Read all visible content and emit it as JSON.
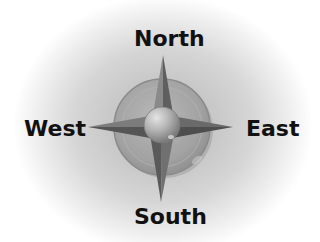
{
  "directions": {
    "north": "North",
    "south": "South",
    "east": "East",
    "west": "West"
  },
  "colors": {
    "background_center": "#bdbdbd",
    "background_edge": "#ffffff",
    "ring": "#9e9e9e",
    "star_point": "#6e6e6e",
    "center_sphere": "#b0b0b0",
    "label_text": "#111111"
  }
}
